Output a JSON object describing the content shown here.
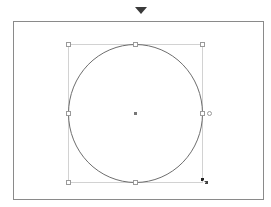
{
  "canvas": {
    "indicator": "down-triangle-marker",
    "shape": {
      "type": "circle",
      "center": [
        135,
        113
      ],
      "radius_x": 67,
      "radius_y": 69,
      "stroke": "#6e6e6e"
    },
    "bounding_box": {
      "left": 68,
      "top": 44,
      "right": 202,
      "bottom": 182,
      "stroke": "#cfcfcf"
    },
    "handle_color": "#9a9a9a",
    "center_point_color": "#777777",
    "cursor": "resize-cursor"
  }
}
